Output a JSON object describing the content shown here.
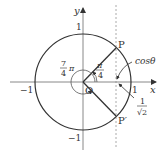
{
  "diagram": {
    "type": "unit-circle",
    "axes": {
      "x_label": "x",
      "y_label": "y",
      "origin_label": "O"
    },
    "ticks": {
      "x_pos": "1",
      "x_neg": "−1",
      "y_pos": "1",
      "y_neg": "−1"
    },
    "points": {
      "P": "P",
      "P_prime": "P′"
    },
    "angles": {
      "pi_over_4": {
        "num": "π",
        "den": "4"
      },
      "seven_pi_over_4": {
        "num": "7",
        "den": "4",
        "suffix": "π"
      }
    },
    "annotations": {
      "cos_theta": "cosθ",
      "one_over_sqrt2": {
        "num": "1",
        "den": "√2"
      }
    },
    "colors": {
      "stroke": "#333333",
      "axis": "#888888",
      "dashed": "#aaaaaa"
    }
  }
}
